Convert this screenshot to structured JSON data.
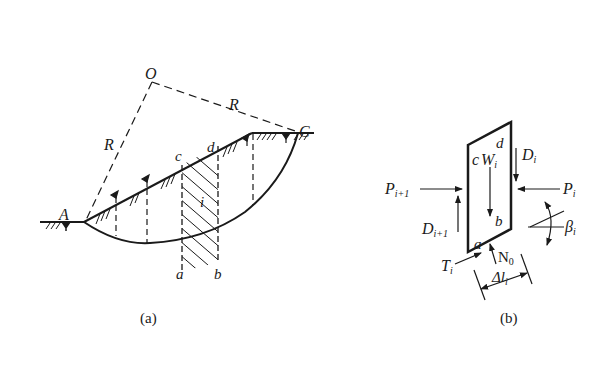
{
  "figure_a": {
    "caption": "(a)",
    "points": {
      "O": "O",
      "A": "A",
      "C": "C",
      "a": "a",
      "b": "b",
      "c": "c",
      "d": "d"
    },
    "radius_label_left": "R",
    "radius_label_right": "R",
    "slice_label": "i"
  },
  "figure_b": {
    "caption": "(b)",
    "corners": {
      "a": "a",
      "b": "b",
      "c": "c",
      "d": "d"
    },
    "forces": {
      "W": "W",
      "W_sub": "i",
      "D_right": "D",
      "D_right_sub": "i",
      "D_left": "D",
      "D_left_sub": "i+1",
      "P_left": "P",
      "P_left_sub": "i+1",
      "P_right": "P",
      "P_right_sub": "i",
      "T": "T",
      "T_sub": "i",
      "N": "N",
      "N_sub": "0",
      "beta": "β",
      "beta_sub": "i",
      "dl": "Δl",
      "dl_sub": "i"
    }
  },
  "colors": {
    "ink": "#1a1a1a",
    "background": "#ffffff"
  }
}
